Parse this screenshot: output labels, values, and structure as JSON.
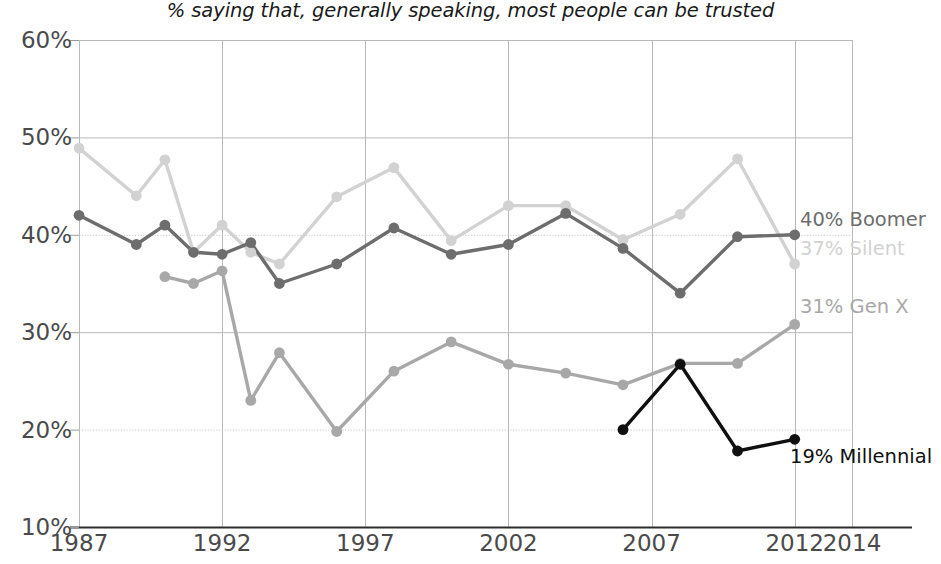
{
  "subtitle": "% saying that, generally speaking, most people can be trusted",
  "axis": {
    "y_ticks": [
      "60%",
      "50%",
      "40%",
      "30%",
      "20%",
      "10%"
    ],
    "x_ticks": [
      "1987",
      "1992",
      "1997",
      "2002",
      "2007",
      "2012",
      "2014"
    ]
  },
  "series_labels": [
    {
      "text": "40% Boomer",
      "color": "#6d6d6d"
    },
    {
      "text": "37% Silent",
      "color": "#d2d2d2"
    },
    {
      "text": "31% Gen X",
      "color": "#a8a8a8"
    },
    {
      "text": "19% Millennial",
      "color": "#101010"
    }
  ],
  "chart_data": {
    "type": "line",
    "title": "",
    "subtitle": "% saying that, generally speaking, most people can be trusted",
    "xlabel": "",
    "ylabel": "",
    "xlim": [
      1987,
      2014
    ],
    "ylim": [
      10,
      60
    ],
    "grid": true,
    "legend_position": "right-end-labels",
    "x_ticks": [
      1987,
      1992,
      1997,
      2002,
      2007,
      2012,
      2014
    ],
    "y_ticks": [
      10,
      20,
      30,
      40,
      50,
      60
    ],
    "series": [
      {
        "name": "Silent",
        "color": "#d2d2d2",
        "end_label": "37% Silent",
        "points": [
          {
            "x": 1987,
            "y": 48.9
          },
          {
            "x": 1989,
            "y": 44.0
          },
          {
            "x": 1990,
            "y": 47.7
          },
          {
            "x": 1991,
            "y": 38.2
          },
          {
            "x": 1992,
            "y": 41.0
          },
          {
            "x": 1993,
            "y": 38.2
          },
          {
            "x": 1994,
            "y": 37.0
          },
          {
            "x": 1996,
            "y": 43.9
          },
          {
            "x": 1998,
            "y": 46.9
          },
          {
            "x": 2000,
            "y": 39.4
          },
          {
            "x": 2002,
            "y": 43.0
          },
          {
            "x": 2004,
            "y": 43.0
          },
          {
            "x": 2006,
            "y": 39.5
          },
          {
            "x": 2008,
            "y": 42.1
          },
          {
            "x": 2010,
            "y": 47.8
          },
          {
            "x": 2012,
            "y": 37.0
          }
        ]
      },
      {
        "name": "Boomer",
        "color": "#6d6d6d",
        "end_label": "40% Boomer",
        "points": [
          {
            "x": 1987,
            "y": 42.0
          },
          {
            "x": 1989,
            "y": 39.0
          },
          {
            "x": 1990,
            "y": 41.0
          },
          {
            "x": 1991,
            "y": 38.2
          },
          {
            "x": 1992,
            "y": 38.0
          },
          {
            "x": 1993,
            "y": 39.2
          },
          {
            "x": 1994,
            "y": 35.0
          },
          {
            "x": 1996,
            "y": 37.0
          },
          {
            "x": 1998,
            "y": 40.7
          },
          {
            "x": 2000,
            "y": 38.0
          },
          {
            "x": 2002,
            "y": 39.0
          },
          {
            "x": 2004,
            "y": 42.2
          },
          {
            "x": 2006,
            "y": 38.6
          },
          {
            "x": 2008,
            "y": 34.0
          },
          {
            "x": 2010,
            "y": 39.8
          },
          {
            "x": 2012,
            "y": 40.0
          }
        ]
      },
      {
        "name": "Gen X",
        "color": "#a8a8a8",
        "end_label": "31% Gen X",
        "points": [
          {
            "x": 1990,
            "y": 35.7
          },
          {
            "x": 1991,
            "y": 35.0
          },
          {
            "x": 1992,
            "y": 36.3
          },
          {
            "x": 1993,
            "y": 23.0
          },
          {
            "x": 1994,
            "y": 27.9
          },
          {
            "x": 1996,
            "y": 19.8
          },
          {
            "x": 1998,
            "y": 26.0
          },
          {
            "x": 2000,
            "y": 29.0
          },
          {
            "x": 2002,
            "y": 26.7
          },
          {
            "x": 2004,
            "y": 25.8
          },
          {
            "x": 2006,
            "y": 24.6
          },
          {
            "x": 2008,
            "y": 26.8
          },
          {
            "x": 2010,
            "y": 26.8
          },
          {
            "x": 2012,
            "y": 30.8
          }
        ]
      },
      {
        "name": "Millennial",
        "color": "#101010",
        "end_label": "19% Millennial",
        "points": [
          {
            "x": 2006,
            "y": 20.0
          },
          {
            "x": 2008,
            "y": 26.7
          },
          {
            "x": 2010,
            "y": 17.8
          },
          {
            "x": 2012,
            "y": 19.0
          }
        ]
      }
    ]
  }
}
